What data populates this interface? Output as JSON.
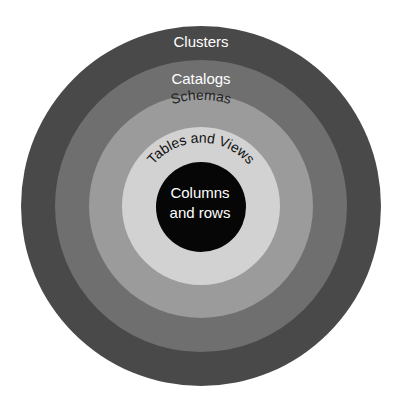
{
  "diagram": {
    "type": "concentric-hierarchy",
    "center": {
      "x": 201,
      "y": 206
    },
    "layers": [
      {
        "label": "Clusters",
        "radius": 180,
        "fill": "#494949",
        "text_color": "#ffffff"
      },
      {
        "label": "Catalogs",
        "radius": 146,
        "fill": "#6f6f6f",
        "text_color": "#ffffff"
      },
      {
        "label": "Schemas",
        "radius": 112,
        "fill": "#9b9b9b",
        "text_color": "#222222"
      },
      {
        "label": "Tables and Views",
        "radius": 79,
        "fill": "#d2d2d2",
        "text_color": "#111111"
      },
      {
        "label_line1": "Columns",
        "label_line2": "and rows",
        "radius": 45,
        "fill": "#060606",
        "text_color": "#ffffff"
      }
    ]
  }
}
